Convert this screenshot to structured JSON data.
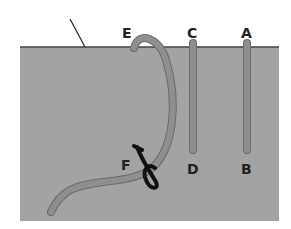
{
  "diagram": {
    "colors": {
      "background": "#ffffff",
      "block_fill": "#a3a3a3",
      "surface_line": "#444444",
      "tube_fill": "#8f8f8f",
      "tube_outline": "#6a6a6a",
      "loop": "#111111",
      "label": "#222222"
    },
    "labels": {
      "E": "E",
      "C": "C",
      "A": "A",
      "F": "F",
      "D": "D",
      "B": "B"
    }
  }
}
